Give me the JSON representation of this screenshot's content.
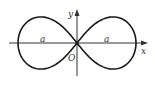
{
  "figure": {
    "labels": {
      "x_axis": "x",
      "y_axis": "y",
      "origin": "O",
      "left_segment": "a",
      "right_segment": "a"
    },
    "geometry": {
      "origin": [
        77,
        43
      ],
      "half_extent": 59,
      "vertical_scale": 1.25,
      "x_axis_range": [
        9,
        148
      ],
      "y_axis_range": [
        10,
        76
      ]
    },
    "colors": {
      "curve": "#1a1a1a",
      "axes": "#333333",
      "background": "#ffffff"
    }
  }
}
